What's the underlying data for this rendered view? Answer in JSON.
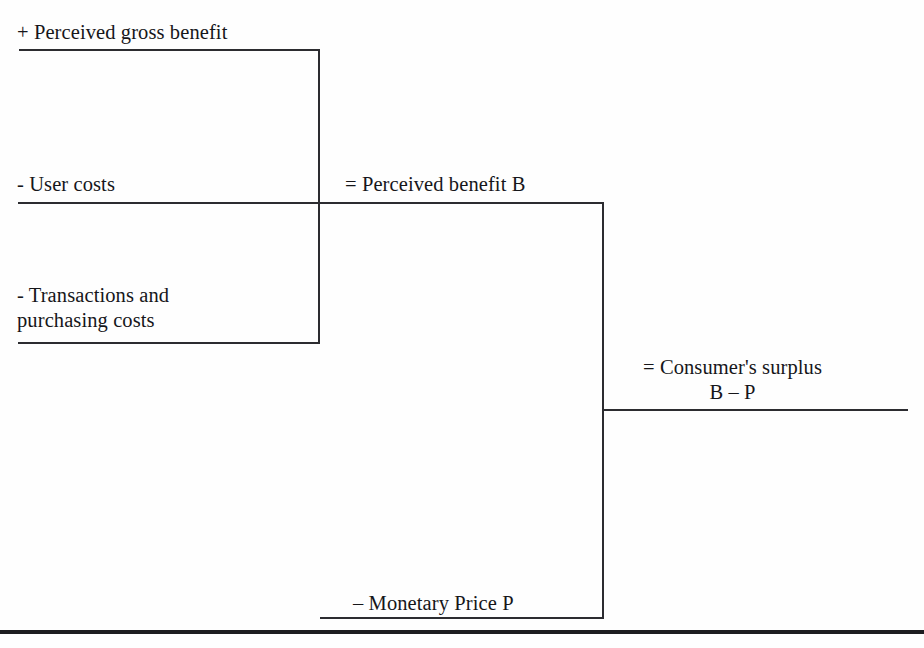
{
  "diagram": {
    "line_color": "#2c2c30",
    "text_color": "#16161a",
    "background": "#fefefe",
    "left_group": {
      "items": [
        {
          "id": "gross-benefit",
          "text": "+ Perceived gross benefit"
        },
        {
          "id": "user-costs",
          "text": "- User costs"
        },
        {
          "id": "transactions",
          "text": "- Transactions and\npurchasing costs"
        }
      ]
    },
    "middle_group": {
      "items": [
        {
          "id": "perceived-benefit",
          "text": "= Perceived benefit B"
        },
        {
          "id": "monetary-price",
          "text": "– Monetary Price P"
        }
      ]
    },
    "right_group": {
      "items": [
        {
          "id": "consumer-surplus",
          "line1": "= Consumer's surplus",
          "line2": "B – P"
        }
      ]
    }
  }
}
